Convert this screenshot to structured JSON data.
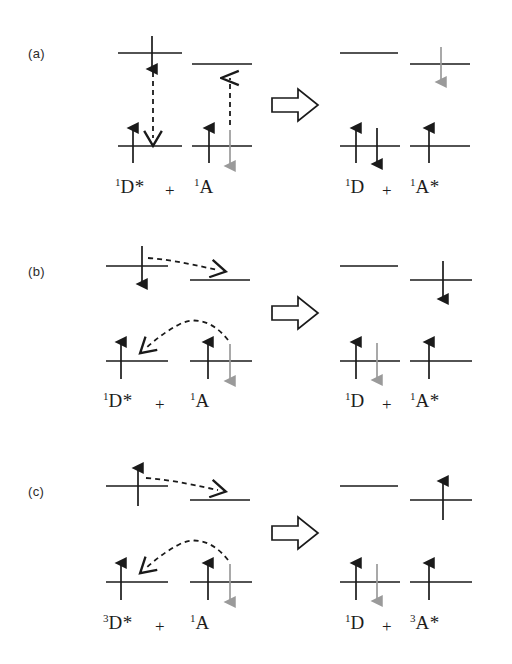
{
  "figure": {
    "type": "energy-level-diagram",
    "background_color": "#ffffff",
    "black": "#1a1a1a",
    "gray": "#9a9a9a"
  },
  "panels": [
    {
      "label": "(a)",
      "name": "forster-resonance-energy-transfer",
      "reactants": {
        "donor": {
          "multiplicity": "1",
          "symbol": "D",
          "star": "*"
        },
        "plus": "+",
        "acceptor": {
          "multiplicity": "1",
          "symbol": "A",
          "star": ""
        }
      },
      "products": {
        "donor": {
          "multiplicity": "1",
          "symbol": "D",
          "star": ""
        },
        "plus": "+",
        "acceptor": {
          "multiplicity": "1",
          "symbol": "A",
          "star": "*"
        }
      },
      "reactant_label": "¹D* + ¹A",
      "product_label": "¹D + ¹A*",
      "transfer_arrows": "two vertical dashed arrows: donor de-excitation down, acceptor excitation up",
      "electrons": {
        "donor_lumo": [
          "black-down"
        ],
        "donor_homo": [
          "black-up"
        ],
        "acceptor_lumo": [],
        "acceptor_homo": [
          "black-up",
          "gray-down"
        ],
        "product_donor_lumo": [],
        "product_donor_homo": [
          "black-up",
          "black-down"
        ],
        "product_acceptor_lumo": [
          "gray-down"
        ],
        "product_acceptor_homo": [
          "black-up"
        ]
      }
    },
    {
      "label": "(b)",
      "name": "dexter-electron-exchange-singlet",
      "reactants": {
        "donor": {
          "multiplicity": "1",
          "symbol": "D",
          "star": "*"
        },
        "plus": "+",
        "acceptor": {
          "multiplicity": "1",
          "symbol": "A",
          "star": ""
        }
      },
      "products": {
        "donor": {
          "multiplicity": "1",
          "symbol": "D",
          "star": ""
        },
        "plus": "+",
        "acceptor": {
          "multiplicity": "1",
          "symbol": "A",
          "star": "*"
        }
      },
      "reactant_label": "¹D* + ¹A",
      "product_label": "¹D + ¹A*",
      "transfer_arrows": "straight dashed arrow from donor LUMO to acceptor LUMO; curved dashed arrow from acceptor HOMO back to donor HOMO",
      "electrons": {
        "donor_lumo": [
          "black-down"
        ],
        "donor_homo": [
          "black-up"
        ],
        "acceptor_lumo": [],
        "acceptor_homo": [
          "black-up",
          "gray-down"
        ],
        "product_donor_lumo": [],
        "product_donor_homo": [
          "black-up",
          "gray-down"
        ],
        "product_acceptor_lumo": [
          "black-down"
        ],
        "product_acceptor_homo": [
          "black-up"
        ]
      }
    },
    {
      "label": "(c)",
      "name": "dexter-electron-exchange-triplet",
      "reactants": {
        "donor": {
          "multiplicity": "3",
          "symbol": "D",
          "star": "*"
        },
        "plus": "+",
        "acceptor": {
          "multiplicity": "1",
          "symbol": "A",
          "star": ""
        }
      },
      "products": {
        "donor": {
          "multiplicity": "1",
          "symbol": "D",
          "star": ""
        },
        "plus": "+",
        "acceptor": {
          "multiplicity": "3",
          "symbol": "A",
          "star": "*"
        }
      },
      "reactant_label": "³D* + ¹A",
      "product_label": "¹D + ³A*",
      "transfer_arrows": "straight dashed arrow from donor LUMO to acceptor LUMO; curved dashed arrow from acceptor HOMO back to donor HOMO",
      "electrons": {
        "donor_lumo": [
          "black-up"
        ],
        "donor_homo": [
          "black-up"
        ],
        "acceptor_lumo": [],
        "acceptor_homo": [
          "black-up",
          "gray-down"
        ],
        "product_donor_lumo": [],
        "product_donor_homo": [
          "black-up",
          "gray-down"
        ],
        "product_acceptor_lumo": [
          "black-up"
        ],
        "product_acceptor_homo": [
          "black-up"
        ]
      }
    }
  ],
  "reaction_arrow": {
    "name": "implies-block-arrow",
    "glyph": "⟹",
    "style": "hollow outlined block arrow pointing right"
  }
}
